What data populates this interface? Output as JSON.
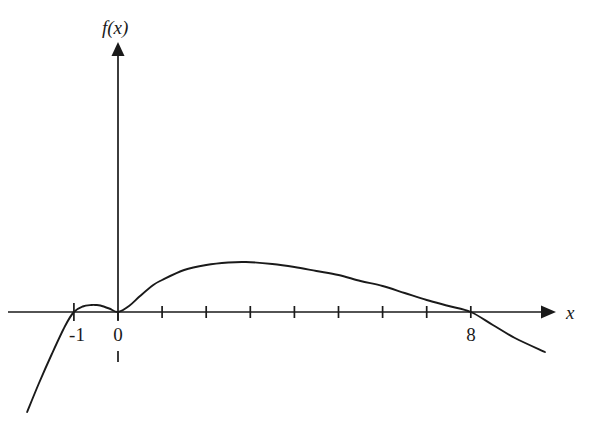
{
  "figure": {
    "background_color": "#ffffff",
    "ink_color": "#1a1a1a",
    "width": 612,
    "height": 443
  },
  "labels": {
    "y_axis": "f(x)",
    "x_axis": "x",
    "origin": "0",
    "root_left": "-1",
    "root_right": "8"
  },
  "chart_data": {
    "type": "line",
    "title": "",
    "subtitle": "",
    "xlabel": "x",
    "ylabel": "f(x)",
    "grid": false,
    "legend": "none",
    "axes": {
      "origin_px": [
        118,
        312
      ],
      "unit_px": 44.1,
      "x_axis_y_px": 312,
      "y_axis_x_px": 118,
      "x_arrow_tip_px": [
        550,
        312
      ],
      "y_arrow_tip_px": [
        118,
        45
      ],
      "xlim_units": [
        -2.06,
        9.8
      ],
      "ylim_units": [
        -2.27,
        6.05
      ]
    },
    "x_ticks": [
      1,
      2,
      3,
      4,
      5,
      6,
      7,
      8
    ],
    "x_tick_labels_shown": [
      "-1",
      "0",
      "8"
    ],
    "y_ticks": [],
    "tick_half_length_px": 6,
    "annotations": [
      {
        "text": "f(x)",
        "role": "y-axis-label",
        "at_px": [
          112,
          28
        ]
      },
      {
        "text": "x",
        "role": "x-axis-label",
        "at_px": [
          570,
          312
        ]
      },
      {
        "text": "-1",
        "role": "x-root-label",
        "at_px": [
          77,
          336
        ]
      },
      {
        "text": "0",
        "role": "origin-label",
        "at_px": [
          118,
          336
        ]
      },
      {
        "text": "8",
        "role": "x-root-label",
        "at_px": [
          471,
          336
        ]
      }
    ],
    "features": {
      "roots": [
        -1,
        0,
        8
      ],
      "root_multiplicity": {
        "-1": 1,
        "0": 2,
        "8": 1
      },
      "local_maximum_small": {
        "x": -0.5,
        "y_px_above_axis": 7
      },
      "local_minimum": {
        "x": 0,
        "y": 0
      },
      "local_maximum_main": {
        "x": 2.9,
        "y_px_above_axis": 50
      },
      "sign": "negative for x < -1, positive on (-1, 0), positive on (0, 8), negative for x > 8",
      "left_branch_end_px": [
        27,
        412
      ],
      "right_branch_end_px": [
        545,
        352
      ]
    },
    "x": [
      -2.06,
      -1.8,
      -1.5,
      -1.2,
      -1.0,
      -0.8,
      -0.6,
      -0.5,
      -0.4,
      -0.2,
      0.0,
      0.25,
      0.5,
      0.8,
      1.0,
      1.5,
      2.0,
      2.5,
      2.9,
      3.5,
      4.0,
      4.5,
      5.0,
      5.5,
      6.0,
      6.5,
      7.0,
      7.5,
      8.0,
      8.5,
      9.0,
      9.68
    ],
    "y_px_above_axis": [
      -100,
      -72,
      -42,
      -14,
      0,
      5.5,
      7,
      7,
      6.5,
      3.5,
      0,
      6,
      16,
      27,
      32,
      42,
      47,
      49.5,
      50,
      48,
      45,
      41,
      37,
      31,
      26,
      19,
      12,
      6,
      0,
      -13,
      -26,
      -40
    ]
  }
}
